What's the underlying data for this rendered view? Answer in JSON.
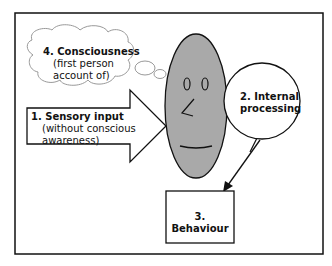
{
  "diagram": {
    "colors": {
      "face": "#a9a9a9",
      "stroke": "#111111",
      "background": "#ffffff"
    },
    "nodes": {
      "consciousness": {
        "title": "4. Consciousness",
        "line1": "(first person",
        "line2": "account of)",
        "shape": "thought-cloud"
      },
      "sensory": {
        "title": "1. Sensory input",
        "line1": "(without conscious",
        "line2": "awareness)",
        "shape": "block-arrow"
      },
      "internal": {
        "title1": "2. Internal",
        "title2": "processing",
        "shape": "speech-circle"
      },
      "behaviour": {
        "title": "3. Behaviour",
        "shape": "box"
      },
      "face": {
        "shape": "ellipse-face"
      }
    },
    "edges": [
      {
        "from": "internal",
        "to": "behaviour",
        "type": "arrow"
      }
    ]
  }
}
